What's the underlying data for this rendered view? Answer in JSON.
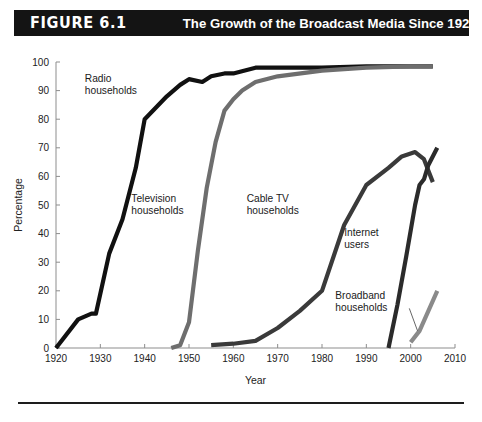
{
  "header": {
    "badge": "FIGURE 6.1",
    "title": "The Growth of the Broadcast Media Since 1920",
    "badge_bg": "#141414",
    "badge_fg": "#ffffff"
  },
  "chart_data": {
    "type": "line",
    "title": "The Growth of the Broadcast Media Since 1920",
    "xlabel": "Year",
    "ylabel": "Percentage",
    "xlim": [
      1920,
      2010
    ],
    "ylim": [
      0,
      100
    ],
    "xticks": [
      1920,
      1930,
      1940,
      1950,
      1960,
      1970,
      1980,
      1990,
      2000,
      2010
    ],
    "yticks": [
      0,
      10,
      20,
      30,
      40,
      50,
      60,
      70,
      80,
      90,
      100
    ],
    "grid": false,
    "legend": "inline-labels",
    "series": [
      {
        "name": "Radio households",
        "color": "#111111",
        "width": 4.2,
        "label_x": 1926.5,
        "label_y": 93,
        "points": [
          [
            1920,
            0
          ],
          [
            1925,
            10
          ],
          [
            1928,
            12
          ],
          [
            1929,
            12
          ],
          [
            1932,
            33
          ],
          [
            1935,
            45
          ],
          [
            1938,
            63
          ],
          [
            1940,
            80
          ],
          [
            1945,
            88
          ],
          [
            1948,
            92
          ],
          [
            1950,
            94
          ],
          [
            1953,
            93
          ],
          [
            1955,
            95
          ],
          [
            1958,
            96
          ],
          [
            1960,
            96
          ],
          [
            1965,
            98
          ],
          [
            1970,
            98
          ],
          [
            1980,
            98
          ],
          [
            1990,
            98.5
          ],
          [
            2000,
            98.5
          ],
          [
            2005,
            98.5
          ]
        ]
      },
      {
        "name": "Television households",
        "color": "#6e6e6e",
        "width": 4.2,
        "label_x": 1937,
        "label_y": 51,
        "points": [
          [
            1946,
            0
          ],
          [
            1948,
            1
          ],
          [
            1950,
            9
          ],
          [
            1952,
            34
          ],
          [
            1954,
            56
          ],
          [
            1956,
            72
          ],
          [
            1958,
            83
          ],
          [
            1960,
            87
          ],
          [
            1962,
            90
          ],
          [
            1965,
            93
          ],
          [
            1970,
            95
          ],
          [
            1980,
            97
          ],
          [
            1990,
            98
          ],
          [
            2000,
            98.5
          ],
          [
            2005,
            98.5
          ]
        ]
      },
      {
        "name": "Cable TV households",
        "color": "#3a3a3a",
        "width": 4.2,
        "label_x": 1963,
        "label_y": 51,
        "points": [
          [
            1955,
            1
          ],
          [
            1960,
            1.5
          ],
          [
            1965,
            2.5
          ],
          [
            1970,
            7
          ],
          [
            1975,
            13
          ],
          [
            1980,
            20
          ],
          [
            1985,
            43
          ],
          [
            1990,
            57
          ],
          [
            1995,
            63
          ],
          [
            1998,
            67
          ],
          [
            2001,
            68.5
          ],
          [
            2003,
            66
          ],
          [
            2004,
            62
          ],
          [
            2005,
            58
          ]
        ]
      },
      {
        "name": "Internet users",
        "color": "#2b2b2b",
        "width": 4.2,
        "label_x": 1985,
        "label_y": 39,
        "points": [
          [
            1995,
            0
          ],
          [
            1997,
            15
          ],
          [
            1999,
            32
          ],
          [
            2001,
            50
          ],
          [
            2002,
            57
          ],
          [
            2003,
            59
          ],
          [
            2004,
            64
          ],
          [
            2006,
            70
          ]
        ]
      },
      {
        "name": "Broadband households",
        "color": "#8a8a8a",
        "width": 4.2,
        "label_x": 1983,
        "label_y": 17,
        "points": [
          [
            2000,
            2
          ],
          [
            2002,
            6
          ],
          [
            2004,
            13
          ],
          [
            2006,
            20
          ]
        ]
      }
    ]
  }
}
